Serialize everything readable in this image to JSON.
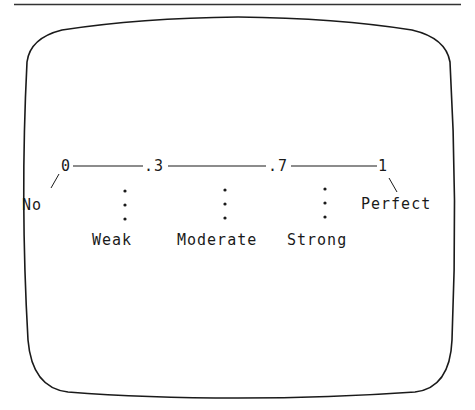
{
  "diagram": {
    "type": "correlation-scale",
    "scale_points": [
      {
        "value": "0",
        "x": 65
      },
      {
        "value": ".3",
        "x": 153
      },
      {
        "value": ".7",
        "x": 278
      },
      {
        "value": "1",
        "x": 382
      }
    ],
    "end_labels": {
      "left": "No",
      "right": "Perfect"
    },
    "range_labels": [
      {
        "label": "Weak",
        "x": 125
      },
      {
        "label": "Moderate",
        "x": 225
      },
      {
        "label": "Strong",
        "x": 325
      }
    ],
    "colors": {
      "ink": "#1a1a1a",
      "background": "#ffffff"
    }
  }
}
